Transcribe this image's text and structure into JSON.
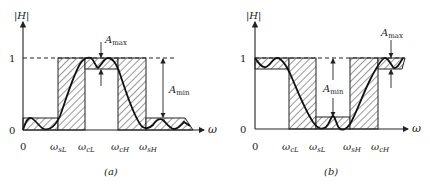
{
  "figure": {
    "panels": [
      {
        "id": "a",
        "caption": "(a)",
        "filter_type": "bandpass",
        "y_axis_label": "|H|",
        "x_axis_label": "ω",
        "y_ticks": [
          "1",
          "0"
        ],
        "x_ticks": [
          {
            "base": "ω",
            "sub": "sL"
          },
          {
            "base": "ω",
            "sub": "cL"
          },
          {
            "base": "ω",
            "sub": "cH"
          },
          {
            "base": "ω",
            "sub": "sH"
          }
        ],
        "origin_label": "0",
        "annotations": {
          "a_max": {
            "base": "A",
            "sub": "max"
          },
          "a_min": {
            "base": "A",
            "sub": "min"
          }
        }
      },
      {
        "id": "b",
        "caption": "(b)",
        "filter_type": "bandstop",
        "y_axis_label": "|H|",
        "x_axis_label": "ω",
        "y_ticks": [
          "1",
          "0"
        ],
        "x_ticks": [
          {
            "base": "ω",
            "sub": "cL"
          },
          {
            "base": "ω",
            "sub": "sL"
          },
          {
            "base": "ω",
            "sub": "sH"
          },
          {
            "base": "ω",
            "sub": "cH"
          }
        ],
        "origin_label": "0",
        "annotations": {
          "a_max": {
            "base": "A",
            "sub": "max"
          },
          "a_min": {
            "base": "A",
            "sub": "min"
          }
        }
      }
    ]
  }
}
